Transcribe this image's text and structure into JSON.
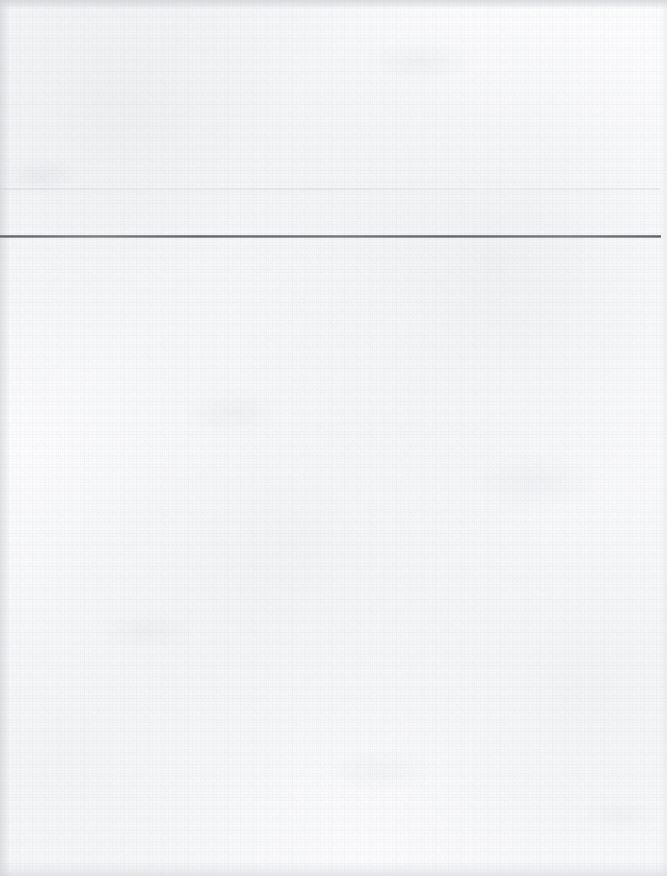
{
  "document": {
    "kind": "scanned-page",
    "page_width": 667,
    "page_height": 876,
    "orientation": "portrait",
    "visible_text": "",
    "header_text": "",
    "body_text": "",
    "footer_text": ""
  },
  "colors": {
    "paper": "#fdfdfd",
    "paper_tint": "#f7f8f9",
    "rule_dark": "#5c5f64",
    "rule_ghost": "#ced1d5",
    "edge_shadow": "#c4c7cb"
  },
  "marks": {
    "main_rule": {
      "name": "horizontal-rule",
      "x": 0,
      "y": 236,
      "width": 661,
      "thickness": 3,
      "color": "#5c5f64",
      "label": ""
    },
    "ghost_rule": {
      "name": "faint-bleed-through-rule",
      "x": 0,
      "y": 188,
      "width": 660,
      "thickness": 2,
      "color": "#ced1d5",
      "label": ""
    }
  },
  "regions": {
    "header": {
      "label": "",
      "top": 0,
      "height": 235
    },
    "body": {
      "label": "",
      "top": 238,
      "height": 638
    }
  }
}
